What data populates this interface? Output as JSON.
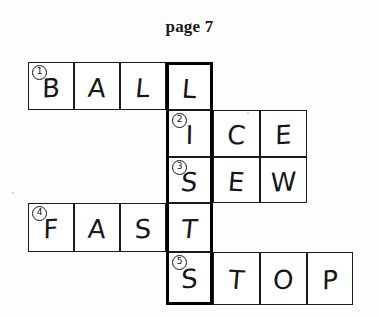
{
  "page": {
    "title": "page 7",
    "background_color": "#fdfdfc",
    "ink_color": "#15171a"
  },
  "puzzle": {
    "type": "crossword",
    "highlighted_column_index": 4,
    "highlighted_column_word": "LISTS",
    "columns": 7,
    "rows": 5,
    "entries": [
      {
        "clue_number": "1",
        "direction": "across",
        "answer": "BALL",
        "row": 1,
        "start_column": 1,
        "letters": [
          "B",
          "A",
          "L",
          "L"
        ]
      },
      {
        "clue_number": "2",
        "direction": "across",
        "answer": "ICE",
        "row": 2,
        "start_column": 4,
        "letters": [
          "I",
          "C",
          "E"
        ]
      },
      {
        "clue_number": "3",
        "direction": "across",
        "answer": "SEW",
        "row": 3,
        "start_column": 4,
        "letters": [
          "S",
          "E",
          "W"
        ]
      },
      {
        "clue_number": "4",
        "direction": "across",
        "answer": "FAST",
        "row": 4,
        "start_column": 1,
        "letters": [
          "F",
          "A",
          "S",
          "T"
        ]
      },
      {
        "clue_number": "5",
        "direction": "across",
        "answer": "STOP",
        "row": 5,
        "start_column": 4,
        "letters": [
          "S",
          "T",
          "O",
          "P"
        ]
      }
    ],
    "cells": [
      {
        "id": "r1c1",
        "letter": "B",
        "clue_number": "1",
        "highlighted": false
      },
      {
        "id": "r1c2",
        "letter": "A",
        "clue_number": "",
        "highlighted": false
      },
      {
        "id": "r1c3",
        "letter": "L",
        "clue_number": "",
        "highlighted": false
      },
      {
        "id": "r1c4",
        "letter": "L",
        "clue_number": "",
        "highlighted": true
      },
      {
        "id": "r2c4",
        "letter": "I",
        "clue_number": "2",
        "highlighted": true
      },
      {
        "id": "r2c5",
        "letter": "C",
        "clue_number": "",
        "highlighted": false
      },
      {
        "id": "r2c6",
        "letter": "E",
        "clue_number": "",
        "highlighted": false
      },
      {
        "id": "r3c4",
        "letter": "S",
        "clue_number": "3",
        "highlighted": true
      },
      {
        "id": "r3c5",
        "letter": "E",
        "clue_number": "",
        "highlighted": false
      },
      {
        "id": "r3c6",
        "letter": "W",
        "clue_number": "",
        "highlighted": false
      },
      {
        "id": "r4c1",
        "letter": "F",
        "clue_number": "4",
        "highlighted": false
      },
      {
        "id": "r4c2",
        "letter": "A",
        "clue_number": "",
        "highlighted": false
      },
      {
        "id": "r4c3",
        "letter": "S",
        "clue_number": "",
        "highlighted": false
      },
      {
        "id": "r4c4",
        "letter": "T",
        "clue_number": "",
        "highlighted": true
      },
      {
        "id": "r5c4",
        "letter": "S",
        "clue_number": "5",
        "highlighted": true
      },
      {
        "id": "r5c5",
        "letter": "T",
        "clue_number": "",
        "highlighted": false
      },
      {
        "id": "r5c6",
        "letter": "O",
        "clue_number": "",
        "highlighted": false
      },
      {
        "id": "r5c7",
        "letter": "P",
        "clue_number": "",
        "highlighted": false
      }
    ]
  }
}
